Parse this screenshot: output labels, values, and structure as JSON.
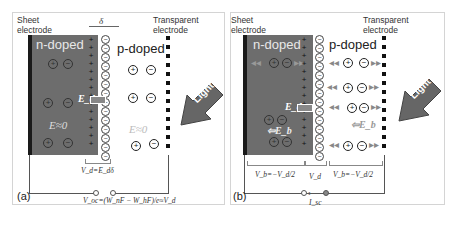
{
  "panels": [
    {
      "id": "a",
      "caption": "(a)",
      "labels": {
        "sheet_electrode": [
          "Sheet",
          "electrode"
        ],
        "transparent_electrode": [
          "Transparent",
          "electrode"
        ],
        "n_doped": "n-doped",
        "p_doped": "p-doped",
        "depletion_width": "δ",
        "field_depletion": "E_d",
        "field_n": "E≈0",
        "field_p": "E≈0",
        "light": "Light",
        "vd_eq": "V_d=E_dδ",
        "voc_eq": "V_oc=(W_nF − W_hF)/e≈V_d"
      }
    },
    {
      "id": "b",
      "caption": "(b)",
      "labels": {
        "sheet_electrode": [
          "Sheet",
          "electrode"
        ],
        "transparent_electrode": [
          "Transparent",
          "electrode"
        ],
        "n_doped": "n-doped",
        "p_doped": "p-doped",
        "field_depletion": "E_d",
        "field_bulk_n": "⇦E_b",
        "field_bulk_p": "⇦E_b",
        "light": "Light",
        "vb_left": "V_b=−V_d/2",
        "vd": "V_d",
        "vb_right": "V_b=−V_d/2",
        "isc": "I_sc"
      }
    }
  ],
  "symbols": {
    "plus": "⊕",
    "minus": "⊖",
    "plus_small": "+",
    "minus_small": "−"
  },
  "colors": {
    "n_region": "#6d6d6d",
    "electrode": "#1a1a1a",
    "light_arrow": "#666666",
    "border": "#d4d4d4"
  }
}
